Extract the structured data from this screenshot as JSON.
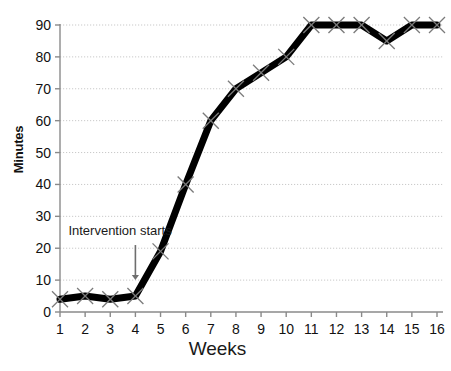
{
  "chart_data": {
    "type": "line",
    "title": "",
    "xlabel": "Weeks",
    "ylabel": "Minutes",
    "categories": [
      1,
      2,
      3,
      4,
      5,
      6,
      7,
      8,
      9,
      10,
      11,
      12,
      13,
      14,
      15,
      16
    ],
    "x_tick_labels": [
      "1",
      "2",
      "3",
      "4",
      "5",
      "6",
      "7",
      "8",
      "9",
      "10",
      "11",
      "12",
      "13",
      "14",
      "15",
      "16"
    ],
    "y_tick_labels": [
      "0",
      "10",
      "20",
      "30",
      "40",
      "50",
      "60",
      "70",
      "80",
      "90"
    ],
    "y_ticks": [
      0,
      10,
      20,
      30,
      40,
      50,
      60,
      70,
      80,
      90
    ],
    "values": [
      4,
      5,
      4,
      5,
      19,
      40,
      60,
      70,
      75,
      80,
      90,
      90,
      90,
      85,
      90,
      90
    ],
    "series": [
      {
        "name": "Minutes",
        "values": [
          4,
          5,
          4,
          5,
          19,
          40,
          60,
          70,
          75,
          80,
          90,
          90,
          90,
          85,
          90,
          90
        ],
        "line_color": "#000000",
        "marker": "x"
      }
    ],
    "xlim": [
      1,
      16
    ],
    "ylim": [
      0,
      90
    ],
    "grid": true,
    "grid_axis": "y",
    "legend": "none",
    "annotations": [
      {
        "text": "Intervention starts",
        "points_to_week": 4,
        "points_to_value": 10,
        "arrow": "down",
        "color": "#6e6e6e"
      }
    ]
  },
  "axes": {
    "y_axis_title": "Minutes",
    "x_axis_title": "Weeks"
  },
  "colors": {
    "line": "#000000",
    "axis": "#8a8a8a",
    "grid": "#c9c9c9",
    "marker": "#7a7a7a",
    "annotation": "#6e6e6e",
    "background": "#ffffff",
    "text": "#111111"
  }
}
